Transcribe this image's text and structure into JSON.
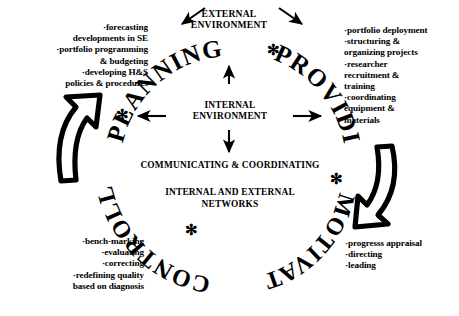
{
  "diagram": {
    "center": {
      "external_environment": "EXTERNAL\nENVIRONMENT",
      "internal_environment": "INTERNAL\nENVIRONMENT",
      "communicating_coordinating": "COMMUNICATING & COORDINATING",
      "networks": "INTERNAL AND EXTERNAL\nNETWORKS"
    },
    "arc_words": {
      "planning": "PLANNING",
      "providing": "PROVIDING",
      "motivating": "MOTIVATING",
      "controlling": "CONTROLLING"
    },
    "markers": {
      "asterisk": "✻"
    },
    "quadrants": [
      {
        "id": "planning",
        "arc_label": "PLANNING",
        "align": "right",
        "items": [
          "·forecasting",
          "developments in SE",
          "·portfolio programming",
          "& budgeting",
          "·developing H&S",
          "policies & procedures"
        ],
        "text": "·forecasting\ndevelopments in SE\n·portfolio programming\n& budgeting\n·developing H&S\npolicies & procedures"
      },
      {
        "id": "providing",
        "arc_label": "PROVIDING",
        "align": "left",
        "items": [
          "·portfolio deployment",
          "·structuring &",
          " organizing projects",
          "·researcher",
          " recruitment &",
          " training",
          "·coordinating",
          " equipment &",
          " materials"
        ],
        "text": "·portfolio deployment\n·structuring &\n organizing projects\n·researcher\n recruitment &\n training\n·coordinating\n equipment &\n materials"
      },
      {
        "id": "controlling",
        "arc_label": "CONTROLLING",
        "align": "right",
        "items": [
          "·bench-marking",
          "·evaluating",
          "·correcting",
          "·redefining quality",
          "based on diagnosis"
        ],
        "text": "·bench-marking\n·evaluating\n·correcting\n·redefining quality\nbased on diagnosis"
      },
      {
        "id": "motivating",
        "arc_label": "MOTIVATING",
        "align": "left",
        "items": [
          "·progresss appraisal",
          "·directing",
          "·leading"
        ],
        "text": "·progresss appraisal\n·directing\n·leading"
      }
    ],
    "arrows": {
      "external_in_left": "arrow pointing down-left into EXTERNAL ENVIRONMENT",
      "external_in_right": "arrow pointing down-right from EXTERNAL ENVIRONMENT",
      "internal_up": "arrow up",
      "internal_down": "arrow down",
      "internal_left": "arrow left",
      "internal_right": "arrow right",
      "cycle_left": "curved block arrow pointing up",
      "cycle_right": "curved block arrow pointing down"
    },
    "colors": {
      "ink": "#000000",
      "background": "#ffffff"
    }
  }
}
